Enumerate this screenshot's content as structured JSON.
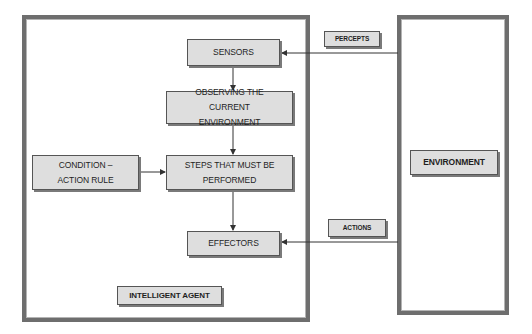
{
  "diagram": {
    "agent": {
      "label": "INTELLIGENT AGENT",
      "nodes": {
        "sensors": "SENSORS",
        "observing": "OBSERVING THE CURRENT ENVIRONMENT",
        "rule": "CONDITION – ACTION RULE",
        "steps": "STEPS THAT MUST BE PERFORMED",
        "effectors": "EFFECTORS"
      }
    },
    "environment": {
      "label": "ENVIRONMENT"
    },
    "edges": {
      "percepts": "PERCEPTS",
      "actions": "ACTIONS"
    },
    "flow": [
      {
        "from": "ENVIRONMENT",
        "to": "SENSORS",
        "label": "PERCEPTS"
      },
      {
        "from": "SENSORS",
        "to": "OBSERVING THE CURRENT ENVIRONMENT"
      },
      {
        "from": "OBSERVING THE CURRENT ENVIRONMENT",
        "to": "STEPS THAT MUST BE PERFORMED"
      },
      {
        "from": "CONDITION – ACTION RULE",
        "to": "STEPS THAT MUST BE PERFORMED"
      },
      {
        "from": "STEPS THAT MUST BE PERFORMED",
        "to": "EFFECTORS"
      },
      {
        "from": "ENVIRONMENT",
        "to": "EFFECTORS",
        "label": "ACTIONS"
      }
    ],
    "colors": {
      "frame_border": "#6e6e6e",
      "box_fill": "#dedede",
      "box_border": "#555555",
      "arrow": "#333333"
    }
  }
}
